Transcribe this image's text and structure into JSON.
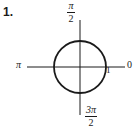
{
  "problem": {
    "number": "1."
  },
  "figure": {
    "type": "unit-circle",
    "background_color": "#ffffff",
    "stroke_color": "#1a1a1a",
    "circle": {
      "center_x": 80,
      "center_y": 67,
      "radius": 26,
      "stroke_width": 1.8
    },
    "axes": {
      "horizontal": {
        "x1": 27,
        "y1": 67,
        "x2": 125,
        "y2": 67,
        "stroke_width": 1
      },
      "vertical": {
        "x1": 80,
        "y1": 20,
        "x2": 80,
        "y2": 115,
        "stroke_width": 1
      }
    },
    "labels": {
      "top": {
        "numerator": "π",
        "denominator": "2",
        "value": "π/2"
      },
      "bottom": {
        "numerator": "3π",
        "denominator": "2",
        "value": "3π/2"
      },
      "left": {
        "text": "π"
      },
      "right_axis_end": {
        "text": "0"
      },
      "radius_point": {
        "text": "1"
      }
    }
  }
}
